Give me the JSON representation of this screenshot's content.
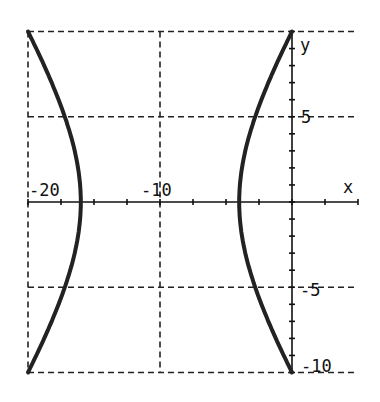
{
  "chart_data": {
    "type": "line",
    "title": "",
    "xlabel": "x",
    "ylabel": "y",
    "xlim": [
      -20,
      5
    ],
    "ylim": [
      -10,
      10
    ],
    "grid": true,
    "grid_style": "dashed",
    "x_tick_labels": [
      "-20",
      "-10"
    ],
    "y_tick_labels": [
      "5",
      "-5",
      "-10"
    ],
    "x_minor_tick_step": 2.5,
    "y_minor_tick_step": 1,
    "equation": "(x+10)^2/36 - y^2/56.25 = 1",
    "series": [
      {
        "name": "left branch",
        "points": [
          [
            -20.0,
            10
          ],
          [
            -18.5,
            7.5
          ],
          [
            -17.4,
            5
          ],
          [
            -16.4,
            2.5
          ],
          [
            -16,
            0
          ],
          [
            -16.4,
            -2.5
          ],
          [
            -17.4,
            -5
          ],
          [
            -18.5,
            -7.5
          ],
          [
            -20.0,
            -10
          ]
        ]
      },
      {
        "name": "right branch",
        "points": [
          [
            0.0,
            10
          ],
          [
            -1.5,
            7.5
          ],
          [
            -2.6,
            5
          ],
          [
            -3.6,
            2.5
          ],
          [
            -4,
            0
          ],
          [
            -3.6,
            -2.5
          ],
          [
            -2.6,
            -5
          ],
          [
            -1.5,
            -7.5
          ],
          [
            0.0,
            -10
          ]
        ]
      }
    ],
    "colors": {
      "curve": "#222222",
      "grid": "#222222",
      "axis": "#111111"
    }
  }
}
